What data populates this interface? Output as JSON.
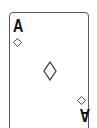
{
  "card": {
    "rank": "A",
    "suit": "diamonds",
    "suit_icon": "diamond-outline-icon",
    "stroke_color": "#333333",
    "background": "#ffffff"
  }
}
